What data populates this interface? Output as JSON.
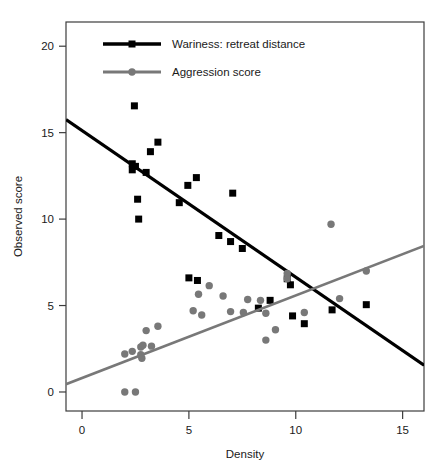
{
  "chart_data": {
    "type": "scatter",
    "title": "",
    "xlabel": "Density",
    "ylabel": "Observed  score",
    "xlim": [
      -0.75,
      16.0
    ],
    "ylim": [
      -1.1,
      21.4
    ],
    "xticks": [
      0,
      5,
      10,
      15
    ],
    "yticks": [
      0,
      5,
      10,
      15,
      20
    ],
    "xtick_labels": [
      "0",
      "5",
      "10",
      "15"
    ],
    "ytick_labels": [
      "0",
      "5",
      "10",
      "15",
      "20"
    ],
    "grid": false,
    "legend_position": "top-center",
    "series": [
      {
        "name": "Wariness: retreat distance",
        "marker": "square",
        "color": "#000000",
        "line_color": "#000000",
        "line_width": 3.2,
        "marker_size": 7,
        "trend_line": {
          "x0": -0.75,
          "y0": 15.75,
          "x1": 16.0,
          "y1": 1.55
        },
        "points": [
          {
            "x": 2.45,
            "y": 16.55
          },
          {
            "x": 3.55,
            "y": 14.45
          },
          {
            "x": 3.2,
            "y": 13.9
          },
          {
            "x": 2.35,
            "y": 13.2
          },
          {
            "x": 2.5,
            "y": 13.05
          },
          {
            "x": 2.35,
            "y": 12.85
          },
          {
            "x": 3.0,
            "y": 12.7
          },
          {
            "x": 5.35,
            "y": 12.4
          },
          {
            "x": 4.95,
            "y": 11.95
          },
          {
            "x": 2.6,
            "y": 11.15
          },
          {
            "x": 7.05,
            "y": 11.5
          },
          {
            "x": 4.55,
            "y": 10.95
          },
          {
            "x": 2.65,
            "y": 10.0
          },
          {
            "x": 6.4,
            "y": 9.05
          },
          {
            "x": 6.95,
            "y": 8.7
          },
          {
            "x": 7.5,
            "y": 8.3
          },
          {
            "x": 5.0,
            "y": 6.6
          },
          {
            "x": 5.4,
            "y": 6.45
          },
          {
            "x": 9.6,
            "y": 6.55
          },
          {
            "x": 9.75,
            "y": 6.2
          },
          {
            "x": 8.8,
            "y": 5.3
          },
          {
            "x": 8.25,
            "y": 4.85
          },
          {
            "x": 11.7,
            "y": 4.75
          },
          {
            "x": 9.85,
            "y": 4.4
          },
          {
            "x": 10.4,
            "y": 3.95
          },
          {
            "x": 13.3,
            "y": 5.05
          }
        ]
      },
      {
        "name": "Aggression score",
        "marker": "circle",
        "color": "#787878",
        "line_color": "#787878",
        "line_width": 2.6,
        "marker_size": 7,
        "trend_line": {
          "x0": -0.75,
          "y0": 0.45,
          "x1": 16.0,
          "y1": 8.45
        },
        "points": [
          {
            "x": 11.65,
            "y": 9.7
          },
          {
            "x": 5.95,
            "y": 6.15
          },
          {
            "x": 5.45,
            "y": 5.65
          },
          {
            "x": 6.6,
            "y": 5.55
          },
          {
            "x": 7.75,
            "y": 5.35
          },
          {
            "x": 8.35,
            "y": 5.3
          },
          {
            "x": 12.05,
            "y": 5.4
          },
          {
            "x": 13.3,
            "y": 7.0
          },
          {
            "x": 9.6,
            "y": 6.85
          },
          {
            "x": 9.6,
            "y": 6.55
          },
          {
            "x": 5.2,
            "y": 4.7
          },
          {
            "x": 5.6,
            "y": 4.45
          },
          {
            "x": 6.95,
            "y": 4.65
          },
          {
            "x": 8.6,
            "y": 4.55
          },
          {
            "x": 10.4,
            "y": 4.6
          },
          {
            "x": 7.55,
            "y": 4.6
          },
          {
            "x": 3.55,
            "y": 3.8
          },
          {
            "x": 3.0,
            "y": 3.55
          },
          {
            "x": 9.05,
            "y": 3.6
          },
          {
            "x": 8.6,
            "y": 3.0
          },
          {
            "x": 2.35,
            "y": 2.35
          },
          {
            "x": 2.75,
            "y": 2.6
          },
          {
            "x": 2.85,
            "y": 2.7
          },
          {
            "x": 3.25,
            "y": 2.65
          },
          {
            "x": 2.0,
            "y": 2.2
          },
          {
            "x": 2.75,
            "y": 2.15
          },
          {
            "x": 2.8,
            "y": 1.95
          },
          {
            "x": 2.0,
            "y": 0.0
          },
          {
            "x": 2.5,
            "y": 0.0
          }
        ]
      }
    ],
    "legend": [
      {
        "label": "Wariness: retreat distance",
        "color": "#000000",
        "marker": "square"
      },
      {
        "label": "Aggression score",
        "color": "#787878",
        "marker": "circle"
      }
    ]
  }
}
